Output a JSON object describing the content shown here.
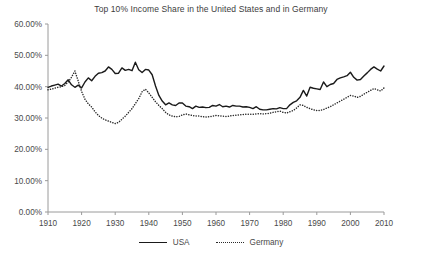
{
  "chart_data": {
    "type": "line",
    "title": "Top 10% Income Share in the United States and in Germany",
    "xlabel": "",
    "ylabel": "",
    "grid": false,
    "legend_position": "bottom-center",
    "xlim": [
      1910,
      2010
    ],
    "ylim": [
      0,
      60
    ],
    "y_tick_labels": [
      "0.00%",
      "10.00%",
      "20.00%",
      "30.00%",
      "40.00%",
      "50.00%",
      "60.00%"
    ],
    "y_ticks": [
      0,
      10,
      20,
      30,
      40,
      50,
      60
    ],
    "x_tick_labels": [
      "1910",
      "1920",
      "1930",
      "1940",
      "1950",
      "1960",
      "1970",
      "1980",
      "1990",
      "2000",
      "2010"
    ],
    "x_ticks": [
      1910,
      1920,
      1930,
      1940,
      1950,
      1960,
      1970,
      1980,
      1990,
      2000,
      2010
    ],
    "value_unit": "percent",
    "series": [
      {
        "name": "USA",
        "style": "solid",
        "color": "#1a1a1a",
        "x": [
          1910,
          1911,
          1912,
          1913,
          1914,
          1915,
          1916,
          1917,
          1918,
          1919,
          1920,
          1921,
          1922,
          1923,
          1924,
          1925,
          1926,
          1927,
          1928,
          1929,
          1930,
          1931,
          1932,
          1933,
          1934,
          1935,
          1936,
          1937,
          1938,
          1939,
          1940,
          1941,
          1942,
          1943,
          1944,
          1945,
          1946,
          1947,
          1948,
          1949,
          1950,
          1951,
          1952,
          1953,
          1954,
          1955,
          1956,
          1957,
          1958,
          1959,
          1960,
          1961,
          1962,
          1963,
          1964,
          1965,
          1966,
          1967,
          1968,
          1969,
          1970,
          1971,
          1972,
          1973,
          1974,
          1975,
          1976,
          1977,
          1978,
          1979,
          1980,
          1981,
          1982,
          1983,
          1984,
          1985,
          1986,
          1987,
          1988,
          1989,
          1990,
          1991,
          1992,
          1993,
          1994,
          1995,
          1996,
          1997,
          1998,
          1999,
          2000,
          2001,
          2002,
          2003,
          2004,
          2005,
          2006,
          2007,
          2008,
          2009,
          2010
        ],
        "values": [
          39.8,
          40.2,
          40.5,
          40.8,
          40.2,
          41.0,
          42.2,
          40.6,
          39.8,
          40.5,
          39.6,
          41.5,
          42.8,
          41.9,
          43.3,
          44.3,
          44.5,
          45.0,
          46.3,
          45.5,
          44.2,
          44.3,
          46.0,
          45.2,
          45.5,
          45.1,
          47.8,
          45.4,
          44.5,
          45.5,
          45.3,
          43.8,
          40.2,
          37.2,
          35.4,
          34.2,
          34.8,
          34.2,
          34.0,
          34.8,
          34.8,
          33.8,
          33.6,
          33.0,
          33.8,
          33.4,
          33.5,
          33.3,
          33.4,
          34.0,
          33.8,
          34.3,
          33.6,
          33.8,
          33.5,
          34.0,
          33.8,
          33.8,
          33.5,
          33.6,
          33.4,
          33.0,
          33.6,
          32.8,
          32.6,
          32.6,
          32.8,
          33.0,
          32.9,
          33.3,
          33.0,
          33.0,
          34.2,
          35.0,
          35.5,
          36.6,
          38.8,
          37.0,
          39.8,
          39.5,
          39.3,
          39.1,
          41.5,
          40.0,
          40.7,
          41.0,
          42.3,
          42.8,
          43.1,
          43.5,
          44.6,
          43.0,
          42.1,
          42.3,
          43.4,
          44.4,
          45.5,
          46.3,
          45.6,
          45.0,
          46.6
        ]
      },
      {
        "name": "Germany",
        "style": "dotted",
        "color": "#2b2b2b",
        "x": [
          1910,
          1911,
          1912,
          1913,
          1914,
          1915,
          1916,
          1917,
          1918,
          1919,
          1920,
          1921,
          1922,
          1923,
          1924,
          1925,
          1926,
          1927,
          1928,
          1929,
          1930,
          1931,
          1932,
          1933,
          1934,
          1935,
          1936,
          1937,
          1938,
          1939,
          1940,
          1941,
          1942,
          1943,
          1944,
          1945,
          1946,
          1947,
          1948,
          1949,
          1950,
          1951,
          1952,
          1953,
          1954,
          1955,
          1956,
          1957,
          1958,
          1959,
          1960,
          1961,
          1962,
          1963,
          1964,
          1965,
          1966,
          1967,
          1968,
          1969,
          1970,
          1971,
          1972,
          1973,
          1974,
          1975,
          1976,
          1977,
          1978,
          1979,
          1980,
          1981,
          1982,
          1983,
          1984,
          1985,
          1986,
          1987,
          1988,
          1989,
          1990,
          1991,
          1992,
          1993,
          1994,
          1995,
          1996,
          1997,
          1998,
          1999,
          2000,
          2001,
          2002,
          2003,
          2004,
          2005,
          2006,
          2007,
          2008,
          2009,
          2010
        ],
        "values": [
          39.0,
          39.2,
          39.5,
          39.8,
          40.0,
          40.4,
          41.5,
          43.0,
          45.0,
          41.8,
          38.5,
          36.0,
          34.5,
          33.5,
          32.0,
          30.8,
          30.0,
          29.4,
          29.0,
          28.6,
          28.2,
          28.6,
          29.6,
          30.6,
          31.8,
          33.0,
          34.6,
          36.2,
          38.4,
          39.2,
          38.0,
          36.6,
          35.2,
          34.0,
          33.0,
          31.8,
          31.0,
          30.6,
          30.4,
          30.5,
          31.0,
          31.3,
          31.0,
          30.8,
          30.6,
          30.6,
          30.4,
          30.3,
          30.4,
          30.6,
          30.8,
          30.7,
          30.6,
          30.5,
          30.6,
          30.8,
          30.9,
          31.0,
          31.1,
          31.2,
          31.2,
          31.2,
          31.3,
          31.4,
          31.3,
          31.4,
          31.5,
          31.8,
          32.0,
          32.2,
          31.8,
          31.6,
          32.0,
          32.4,
          33.2,
          34.2,
          34.0,
          33.4,
          33.0,
          32.6,
          32.4,
          32.4,
          32.7,
          33.2,
          33.6,
          34.2,
          34.8,
          35.4,
          36.0,
          36.6,
          37.2,
          37.0,
          36.6,
          36.9,
          37.6,
          38.2,
          38.8,
          39.4,
          39.0,
          38.6,
          39.6
        ]
      }
    ]
  },
  "legend": {
    "items": [
      {
        "label": "USA",
        "style": "solid"
      },
      {
        "label": "Germany",
        "style": "dotted"
      }
    ]
  }
}
